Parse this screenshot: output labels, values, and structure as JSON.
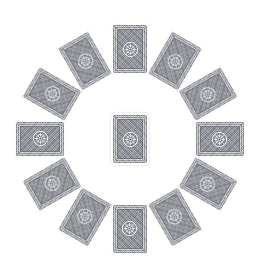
{
  "scene": {
    "title": "Playing card back arrangement",
    "description": "Thirteen face-down playing cards: twelve arranged in a circular ring and one in the center",
    "background_color": "#ffffff",
    "width": 261,
    "height": 278,
    "card_count": 13,
    "ring_card_count": 12,
    "center_card_count": 1
  },
  "card_style": {
    "face": "card-back",
    "pattern_name": "ornate-rosette-lattice",
    "border_color": "#fdfdfd",
    "field_color": "#8e9097",
    "ink_color": "#4a4c56",
    "highlight_color": "#ffffff",
    "width_px": 38,
    "height_px": 52,
    "corner_radius_px": 3.2
  },
  "ring": {
    "center_x": 130,
    "center_y": 139,
    "radius_px": 90,
    "step_degrees": 30,
    "cards": [
      {
        "index": 0,
        "label": "ring-card-1",
        "angle": 0,
        "rotation": 0,
        "cx": 130,
        "cy": 49
      },
      {
        "index": 1,
        "label": "ring-card-2",
        "angle": 30,
        "rotation": 30,
        "cx": 175,
        "cy": 61
      },
      {
        "index": 2,
        "label": "ring-card-3",
        "angle": 60,
        "rotation": 60,
        "cx": 208,
        "cy": 94
      },
      {
        "index": 3,
        "label": "ring-card-4",
        "angle": 90,
        "rotation": 90,
        "cx": 220,
        "cy": 139
      },
      {
        "index": 4,
        "label": "ring-card-5",
        "angle": 120,
        "rotation": 120,
        "cx": 208,
        "cy": 184
      },
      {
        "index": 5,
        "label": "ring-card-6",
        "angle": 150,
        "rotation": 150,
        "cx": 175,
        "cy": 217
      },
      {
        "index": 6,
        "label": "ring-card-7",
        "angle": 180,
        "rotation": 180,
        "cx": 130,
        "cy": 229
      },
      {
        "index": 7,
        "label": "ring-card-8",
        "angle": 210,
        "rotation": 210,
        "cx": 85,
        "cy": 217
      },
      {
        "index": 8,
        "label": "ring-card-9",
        "angle": 240,
        "rotation": 240,
        "cx": 52,
        "cy": 184
      },
      {
        "index": 9,
        "label": "ring-card-10",
        "angle": 270,
        "rotation": 270,
        "cx": 40,
        "cy": 139
      },
      {
        "index": 10,
        "label": "ring-card-11",
        "angle": 300,
        "rotation": 300,
        "cx": 52,
        "cy": 94
      },
      {
        "index": 11,
        "label": "ring-card-12",
        "angle": 330,
        "rotation": 330,
        "cx": 85,
        "cy": 61
      }
    ]
  },
  "center_card": {
    "label": "center-card",
    "rotation": 0,
    "cx": 130,
    "cy": 139
  }
}
